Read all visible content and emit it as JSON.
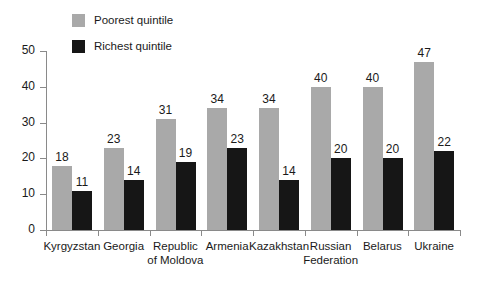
{
  "chart_data": {
    "type": "bar",
    "title": "",
    "subtitle": "",
    "xlabel": "",
    "ylabel": "",
    "ylim": [
      0,
      50
    ],
    "yticks": [
      0,
      10,
      20,
      30,
      40,
      50
    ],
    "grid": false,
    "legend_position": "top-left",
    "orientation": "vertical",
    "grouping": "grouped",
    "categories": [
      "Kyrgyzstan",
      "Georgia",
      "Republic of Moldova",
      "Armenia",
      "Kazakhstan",
      "Russian Federation",
      "Belarus",
      "Ukraine"
    ],
    "category_lines": [
      [
        "Kyrgyzstan"
      ],
      [
        "Georgia"
      ],
      [
        "Republic",
        "of Moldova"
      ],
      [
        "Armenia"
      ],
      [
        "Kazakhstan"
      ],
      [
        "Russian",
        "Federation"
      ],
      [
        "Belarus"
      ],
      [
        "Ukraine"
      ]
    ],
    "series": [
      {
        "name": "Poorest quintile",
        "color": "#a9a9a9",
        "values": [
          18,
          23,
          31,
          34,
          34,
          40,
          40,
          47
        ]
      },
      {
        "name": "Richest quintile",
        "color": "#161616",
        "values": [
          11,
          14,
          19,
          23,
          14,
          20,
          20,
          22
        ]
      }
    ]
  },
  "axis": {
    "tick_labels": [
      "0",
      "10",
      "20",
      "30",
      "40",
      "50"
    ]
  },
  "legend": {
    "items": [
      {
        "label": "Poorest quintile",
        "color": "#a9a9a9"
      },
      {
        "label": "Richest quintile",
        "color": "#161616"
      }
    ]
  }
}
